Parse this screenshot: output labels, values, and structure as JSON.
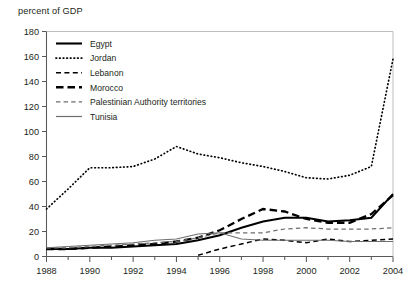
{
  "chart_data": {
    "type": "line",
    "title": "percent of GDP",
    "xlabel": "",
    "ylabel": "percent of GDP",
    "xlim": [
      1988,
      2004
    ],
    "ylim": [
      0,
      180
    ],
    "ytick_step": 20,
    "yticks": [
      0,
      20,
      40,
      60,
      80,
      100,
      120,
      140,
      160,
      180
    ],
    "ytick_labels": [
      "0",
      "20",
      "40",
      "60",
      "80",
      "100",
      "120",
      "140",
      "160",
      "180"
    ],
    "xticks": [
      1988,
      1990,
      1992,
      1994,
      1996,
      1998,
      2000,
      2002,
      2004
    ],
    "xtick_labels": [
      "1988",
      "1990",
      "1992",
      "1994",
      "1996",
      "1998",
      "2000",
      "2002",
      "2004"
    ],
    "x_minor_ticks_every": 1,
    "grid": false,
    "legend_position": "top-left-inside",
    "x": [
      1988,
      1989,
      1990,
      1991,
      1992,
      1993,
      1994,
      1995,
      1996,
      1997,
      1998,
      1999,
      2000,
      2001,
      2002,
      2003,
      2004
    ],
    "series": [
      {
        "name": "Egypt",
        "style": "solid",
        "weight": "medium",
        "color": "#000000",
        "values": [
          6,
          6,
          7,
          7,
          8,
          9,
          10,
          13,
          17,
          23,
          28,
          31,
          31,
          28,
          29,
          31,
          50
        ]
      },
      {
        "name": "Jordan",
        "style": "dotted",
        "weight": "thin",
        "color": "#000000",
        "values": [
          38,
          54,
          71,
          71,
          72,
          78,
          88,
          82,
          79,
          75,
          72,
          68,
          63,
          62,
          65,
          72,
          158
        ]
      },
      {
        "name": "Lebanon",
        "style": "dashed",
        "weight": "medium",
        "color": "#000000",
        "values": [
          null,
          null,
          null,
          null,
          null,
          null,
          null,
          1,
          6,
          10,
          14,
          13,
          11,
          14,
          12,
          13,
          14
        ]
      },
      {
        "name": "Morocco",
        "style": "dashed-thick",
        "weight": "thick",
        "color": "#000000",
        "values": [
          6,
          6,
          7,
          8,
          9,
          10,
          12,
          15,
          21,
          30,
          38,
          36,
          30,
          27,
          27,
          34,
          49
        ]
      },
      {
        "name": "Palestinian Authority territories",
        "style": "dashed-thin",
        "weight": "thin",
        "color": "#6d6e71",
        "values": [
          7,
          7,
          8,
          9,
          10,
          11,
          12,
          15,
          19,
          19,
          19,
          22,
          23,
          22,
          22,
          22,
          23
        ]
      },
      {
        "name": "Tunisia",
        "style": "solid-thin",
        "weight": "thin",
        "color": "#6d6e71",
        "values": [
          7,
          8,
          9,
          10,
          11,
          13,
          14,
          18,
          19,
          14,
          13,
          13,
          13,
          13,
          12,
          12,
          12
        ]
      }
    ]
  },
  "legend": {
    "items": [
      {
        "label": "Egypt",
        "key": "egypt"
      },
      {
        "label": "Jordan",
        "key": "jordan"
      },
      {
        "label": "Lebanon",
        "key": "lebanon"
      },
      {
        "label": "Morocco",
        "key": "morocco"
      },
      {
        "label": "Palestinian Authority territories",
        "key": "pat"
      },
      {
        "label": "Tunisia",
        "key": "tunisia"
      }
    ]
  }
}
